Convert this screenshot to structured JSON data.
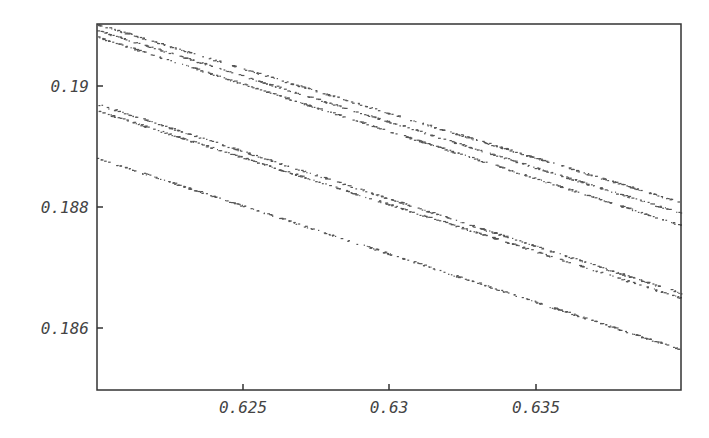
{
  "chart_data": {
    "type": "scatter",
    "title": "",
    "xlabel": "",
    "ylabel": "",
    "xlim": [
      0.62,
      0.6399
    ],
    "ylim": [
      0.18498,
      0.19102
    ],
    "grid": false,
    "legend": null,
    "x_ticks": [
      0.625,
      0.63,
      0.635
    ],
    "x_tick_labels": [
      "0.625",
      "0.63",
      "0.635"
    ],
    "y_ticks": [
      0.186,
      0.188,
      0.19
    ],
    "y_tick_labels": [
      "0.186",
      "0.188",
      "0.19"
    ],
    "series": [
      {
        "name": "band-1",
        "x": [
          0.62,
          0.6399
        ],
        "y": [
          0.19102,
          0.18808
        ]
      },
      {
        "name": "band-2",
        "x": [
          0.62,
          0.6399
        ],
        "y": [
          0.19092,
          0.1879
        ]
      },
      {
        "name": "band-3",
        "x": [
          0.62,
          0.6399
        ],
        "y": [
          0.19081,
          0.1877
        ]
      },
      {
        "name": "band-4",
        "x": [
          0.62,
          0.6399
        ],
        "y": [
          0.1897,
          0.18658
        ]
      },
      {
        "name": "band-5",
        "x": [
          0.62,
          0.6399
        ],
        "y": [
          0.18959,
          0.1865
        ]
      },
      {
        "name": "band-6",
        "x": [
          0.62,
          0.6399
        ],
        "y": [
          0.18881,
          0.18565
        ]
      }
    ],
    "point_color": "#555555",
    "axis_color": "#333333"
  },
  "axes": {
    "x_labels": [
      "0.625",
      "0.63",
      "0.635"
    ],
    "y_labels": [
      "0.19",
      "0.188",
      "0.186"
    ]
  }
}
